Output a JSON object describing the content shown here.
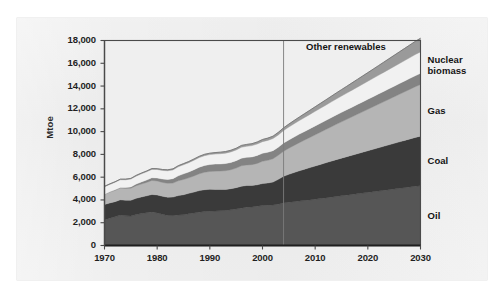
{
  "figure": {
    "background_color": "#ececec",
    "plot_background_color": "#efefef",
    "axis_color": "#4a4a4a"
  },
  "chart_data": {
    "type": "area",
    "stacked": true,
    "title": "",
    "subtitle": "",
    "xlabel": "",
    "ylabel": "Mtoe",
    "xlim": [
      1970,
      2030
    ],
    "ylim": [
      0,
      18000
    ],
    "ytick_labels": [
      "18,000",
      "16,000",
      "14,000",
      "12,000",
      "10,000",
      "8,000",
      "6,000",
      "4,000",
      "2,000",
      "0"
    ],
    "ytick_values": [
      18000,
      16000,
      14000,
      12000,
      10000,
      8000,
      6000,
      4000,
      2000,
      0
    ],
    "xtick_labels": [
      "1970",
      "1980",
      "1990",
      "2000",
      "2010",
      "2020",
      "2030"
    ],
    "xtick_values": [
      1970,
      1980,
      1990,
      2000,
      2010,
      2020,
      2030
    ],
    "grid": false,
    "legend_position": "right-outside",
    "annotations": [
      {
        "text": "Other renewables",
        "x": 2017,
        "y": 17400,
        "placement": "inside-top-right"
      }
    ],
    "divider_line": {
      "x": 2004,
      "label": "",
      "color": "#7a7a7a"
    },
    "x": [
      1970,
      1971,
      1972,
      1973,
      1974,
      1975,
      1976,
      1977,
      1978,
      1979,
      1980,
      1981,
      1982,
      1983,
      1984,
      1985,
      1986,
      1987,
      1988,
      1989,
      1990,
      1991,
      1992,
      1993,
      1994,
      1995,
      1996,
      1997,
      1998,
      1999,
      2000,
      2001,
      2002,
      2003,
      2004,
      2005,
      2006,
      2007,
      2008,
      2009,
      2010,
      2011,
      2012,
      2013,
      2014,
      2015,
      2016,
      2017,
      2018,
      2019,
      2020,
      2021,
      2022,
      2023,
      2024,
      2025,
      2026,
      2027,
      2028,
      2029,
      2030
    ],
    "series": [
      {
        "name": "Oil",
        "color": "#565656",
        "label_color": "#141414",
        "values": [
          2250,
          2400,
          2520,
          2670,
          2610,
          2580,
          2720,
          2800,
          2880,
          2950,
          2860,
          2740,
          2640,
          2620,
          2680,
          2700,
          2790,
          2850,
          2930,
          2980,
          3000,
          3020,
          3060,
          3070,
          3140,
          3200,
          3280,
          3360,
          3380,
          3450,
          3510,
          3530,
          3560,
          3630,
          3740,
          3800,
          3850,
          3900,
          3950,
          4000,
          4060,
          4120,
          4180,
          4240,
          4300,
          4360,
          4420,
          4480,
          4540,
          4600,
          4660,
          4720,
          4780,
          4840,
          4900,
          4960,
          5020,
          5080,
          5140,
          5200,
          5250
        ]
      },
      {
        "name": "Coal",
        "color": "#3a3a3a",
        "label_color": "#141414",
        "values": [
          1350,
          1340,
          1330,
          1340,
          1360,
          1390,
          1420,
          1460,
          1480,
          1530,
          1580,
          1580,
          1600,
          1630,
          1700,
          1760,
          1790,
          1840,
          1890,
          1920,
          1930,
          1900,
          1860,
          1850,
          1850,
          1880,
          1920,
          1910,
          1890,
          1880,
          1930,
          1960,
          2010,
          2180,
          2330,
          2450,
          2560,
          2660,
          2750,
          2840,
          2920,
          3000,
          3080,
          3160,
          3240,
          3310,
          3380,
          3450,
          3520,
          3590,
          3660,
          3730,
          3800,
          3870,
          3940,
          4010,
          4080,
          4150,
          4220,
          4290,
          4350
        ]
      },
      {
        "name": "Gas",
        "color": "#b5b5b5",
        "label_color": "#141414",
        "values": [
          890,
          940,
          990,
          1030,
          1040,
          1060,
          1110,
          1140,
          1180,
          1230,
          1230,
          1220,
          1220,
          1230,
          1300,
          1340,
          1360,
          1420,
          1480,
          1530,
          1570,
          1610,
          1620,
          1650,
          1660,
          1720,
          1800,
          1800,
          1830,
          1880,
          1960,
          1990,
          2050,
          2120,
          2200,
          2290,
          2380,
          2470,
          2560,
          2650,
          2740,
          2830,
          2920,
          3010,
          3100,
          3190,
          3280,
          3370,
          3460,
          3550,
          3640,
          3730,
          3820,
          3910,
          4000,
          4090,
          4180,
          4270,
          4360,
          4450,
          4540
        ]
      },
      {
        "name": "Nuclear",
        "color": "#838383",
        "label_color": "#141414",
        "values": [
          20,
          30,
          45,
          60,
          80,
          110,
          140,
          180,
          210,
          240,
          260,
          300,
          340,
          390,
          440,
          490,
          520,
          550,
          580,
          600,
          610,
          620,
          620,
          630,
          640,
          650,
          670,
          670,
          680,
          700,
          700,
          710,
          710,
          700,
          720,
          730,
          740,
          750,
          760,
          770,
          780,
          790,
          800,
          810,
          820,
          830,
          840,
          850,
          860,
          870,
          880,
          890,
          900,
          910,
          920,
          930,
          940,
          950,
          960,
          970,
          980
        ]
      },
      {
        "name": "biomass",
        "color": "#f1f1f1",
        "label_color": "#141414",
        "values": [
          640,
          650,
          660,
          670,
          680,
          690,
          700,
          710,
          720,
          730,
          740,
          750,
          760,
          770,
          790,
          800,
          810,
          830,
          840,
          860,
          870,
          880,
          900,
          910,
          930,
          940,
          960,
          970,
          990,
          1000,
          1020,
          1040,
          1060,
          1080,
          1100,
          1130,
          1160,
          1190,
          1220,
          1250,
          1280,
          1310,
          1340,
          1370,
          1400,
          1430,
          1460,
          1490,
          1520,
          1550,
          1580,
          1610,
          1640,
          1670,
          1700,
          1730,
          1760,
          1790,
          1820,
          1850,
          1880
        ]
      },
      {
        "name": "Other renewables",
        "color": "#9a9a9a",
        "label_color": "#141414",
        "values": [
          50,
          52,
          55,
          58,
          60,
          63,
          66,
          70,
          73,
          76,
          80,
          84,
          88,
          92,
          96,
          100,
          105,
          110,
          115,
          120,
          125,
          130,
          135,
          140,
          145,
          150,
          158,
          165,
          172,
          180,
          190,
          200,
          210,
          225,
          240,
          260,
          285,
          310,
          340,
          370,
          400,
          430,
          460,
          495,
          530,
          565,
          600,
          640,
          680,
          720,
          760,
          800,
          845,
          890,
          935,
          980,
          1025,
          1070,
          1115,
          1160,
          1200
        ]
      }
    ],
    "series_labels_right": [
      {
        "text": "Nuclear",
        "series": "Nuclear"
      },
      {
        "text": "biomass",
        "series": "biomass"
      },
      {
        "text": "Gas",
        "series": "Gas"
      },
      {
        "text": "Coal",
        "series": "Coal"
      },
      {
        "text": "Oil",
        "series": "Oil"
      }
    ]
  }
}
